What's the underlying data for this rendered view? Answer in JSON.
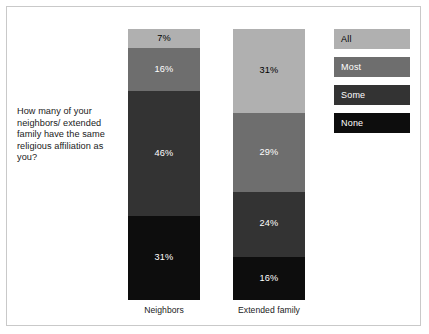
{
  "chart_data": {
    "type": "bar",
    "subtype": "stacked-100-percent",
    "title": "",
    "question": "How many of your neighbors/ extended family have the same religious affiliation as you?",
    "categories": [
      "Neighbors",
      "Extended family"
    ],
    "xlabel": "",
    "ylabel": "",
    "ylim": [
      0,
      100
    ],
    "grid": false,
    "legend_position": "right",
    "stack_order_top_to_bottom": [
      "All",
      "Most",
      "Some",
      "None"
    ],
    "series": [
      {
        "name": "All",
        "color": "#b0b0b0",
        "label_color": "#000000",
        "values": [
          7,
          31
        ],
        "value_labels": [
          "7%",
          "31%"
        ]
      },
      {
        "name": "Most",
        "color": "#6e6e6e",
        "label_color": "#ffffff",
        "values": [
          16,
          29
        ],
        "value_labels": [
          "16%",
          "29%"
        ]
      },
      {
        "name": "Some",
        "color": "#333333",
        "label_color": "#ffffff",
        "values": [
          46,
          24
        ],
        "value_labels": [
          "46%",
          "24%"
        ]
      },
      {
        "name": "None",
        "color": "#0d0d0d",
        "label_color": "#ffffff",
        "values": [
          31,
          16
        ],
        "value_labels": [
          "31%",
          "16%"
        ]
      }
    ],
    "legend": [
      {
        "label": "All",
        "color": "#b0b0b0",
        "text_color": "#000000"
      },
      {
        "label": "Most",
        "color": "#6e6e6e",
        "text_color": "#ffffff"
      },
      {
        "label": "Some",
        "color": "#333333",
        "text_color": "#ffffff"
      },
      {
        "label": "None",
        "color": "#0d0d0d",
        "text_color": "#ffffff"
      }
    ]
  },
  "colors": {
    "frame_border": "#c9c9c9",
    "background": "#ffffff",
    "text": "#1a1a1a"
  }
}
